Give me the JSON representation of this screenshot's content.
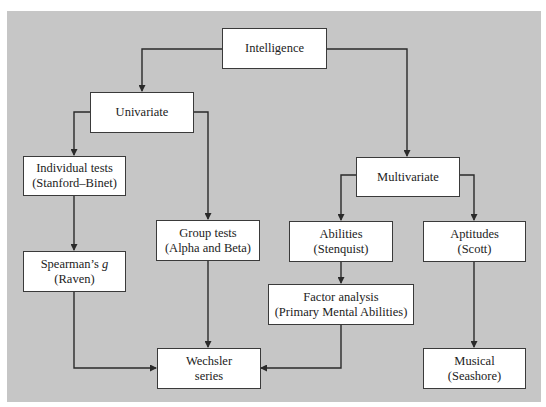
{
  "diagram": {
    "type": "hierarchy-flowchart",
    "nodes": {
      "intelligence": {
        "lines": [
          "Intelligence"
        ]
      },
      "univariate": {
        "lines": [
          "Univariate"
        ]
      },
      "multivariate": {
        "lines": [
          "Multivariate"
        ]
      },
      "individual_tests": {
        "lines": [
          "Individual tests",
          "(Stanford–Binet)"
        ]
      },
      "group_tests": {
        "lines": [
          "Group tests",
          "(Alpha and Beta)"
        ]
      },
      "spearman": {
        "line1_prefix": "Spearman’s ",
        "line1_italic": "g",
        "line2": "(Raven)"
      },
      "abilities": {
        "lines": [
          "Abilities",
          "(Stenquist)"
        ]
      },
      "aptitudes": {
        "lines": [
          "Aptitudes",
          "(Scott)"
        ]
      },
      "factor_analysis": {
        "lines": [
          "Factor analysis",
          "(Primary Mental Abilities)"
        ]
      },
      "wechsler": {
        "lines": [
          "Wechsler",
          "series"
        ]
      },
      "musical": {
        "lines": [
          "Musical",
          "(Seashore)"
        ]
      }
    },
    "edges": [
      {
        "from": "Intelligence",
        "to": "Univariate"
      },
      {
        "from": "Intelligence",
        "to": "Multivariate"
      },
      {
        "from": "Univariate",
        "to": "Individual tests"
      },
      {
        "from": "Univariate",
        "to": "Group tests"
      },
      {
        "from": "Individual tests",
        "to": "Spearman's g"
      },
      {
        "from": "Spearman's g",
        "to": "Wechsler series"
      },
      {
        "from": "Group tests",
        "to": "Wechsler series"
      },
      {
        "from": "Multivariate",
        "to": "Abilities"
      },
      {
        "from": "Multivariate",
        "to": "Aptitudes"
      },
      {
        "from": "Abilities",
        "to": "Factor analysis"
      },
      {
        "from": "Factor analysis",
        "to": "Wechsler series"
      },
      {
        "from": "Aptitudes",
        "to": "Musical"
      }
    ],
    "colors": {
      "background": "#c6c6c6",
      "box_fill": "#ffffff",
      "line": "#2a2a2a"
    }
  }
}
